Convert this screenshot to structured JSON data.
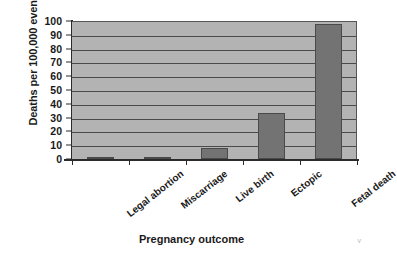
{
  "chart_data": {
    "type": "bar",
    "title": "",
    "xlabel": "Pregnancy outcome",
    "ylabel": "Deaths per 100,000 events",
    "categories": [
      "Legal abortion",
      "Miscarriage",
      "Live birth",
      "Ectopic",
      "Fetal death"
    ],
    "values": [
      0.6,
      1.5,
      8,
      33,
      98
    ],
    "ylim": [
      0,
      100
    ],
    "ytick_labels": [
      "100",
      "90",
      "80",
      "70",
      "60",
      "50",
      "40",
      "30",
      "20",
      "10",
      "0"
    ],
    "ytick_values": [
      100,
      90,
      80,
      70,
      60,
      50,
      40,
      30,
      20,
      10,
      0
    ],
    "grid": true,
    "legend": "none",
    "colors": {
      "bar_fill": "#737373",
      "bar_border": "#4a4a4a",
      "plot_background": "#b3b3b3",
      "gridline": "#4a4a4a",
      "axis": "#2b2b2b",
      "text": "#1a1a1a",
      "page_background": "#ffffff"
    }
  }
}
